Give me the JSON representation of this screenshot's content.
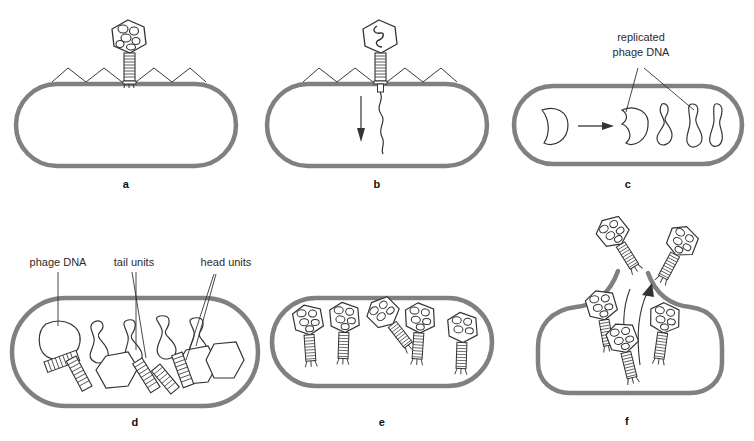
{
  "figure": {
    "background_color": "#ffffff",
    "cell_wall_color": "#808080",
    "line_color": "#333333",
    "label_color": "#2b2b2b"
  },
  "panels": [
    {
      "id": "a",
      "letter": "a",
      "caption": "",
      "stage": "attachment",
      "phage_count": 1,
      "cell_intact": true,
      "labels": []
    },
    {
      "id": "b",
      "letter": "b",
      "caption": "",
      "stage": "dna-injection",
      "phage_count": 1,
      "cell_intact": true,
      "labels": []
    },
    {
      "id": "c",
      "letter": "c",
      "caption": "",
      "stage": "dna-replication",
      "dna_blobs": 5,
      "cell_intact": true,
      "labels": [
        {
          "id": "replicated-phage-dna",
          "line1": "replicated",
          "line2": "phage DNA"
        }
      ]
    },
    {
      "id": "d",
      "letter": "d",
      "caption": "",
      "stage": "component-synthesis",
      "cell_intact": true,
      "labels": [
        {
          "id": "phage-dna",
          "line1": "phage DNA",
          "line2": ""
        },
        {
          "id": "tail-units",
          "line1": "tail units",
          "line2": ""
        },
        {
          "id": "head-units",
          "line1": "head units",
          "line2": ""
        }
      ]
    },
    {
      "id": "e",
      "letter": "e",
      "caption": "",
      "stage": "assembly",
      "phage_count": 5,
      "cell_intact": true,
      "labels": []
    },
    {
      "id": "f",
      "letter": "f",
      "caption": "",
      "stage": "lysis-release",
      "phage_count": 5,
      "cell_intact": false,
      "labels": []
    }
  ]
}
